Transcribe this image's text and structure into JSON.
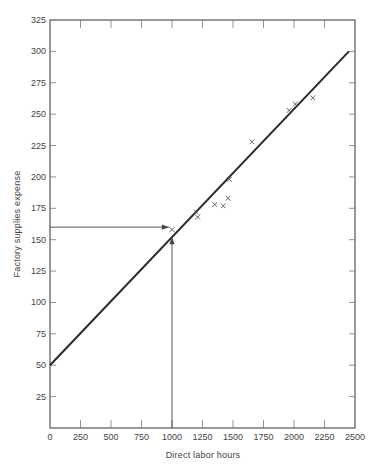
{
  "chart_data": {
    "type": "scatter",
    "title": "",
    "xlabel": "Direct labor hours",
    "ylabel": "Factory supplies expense",
    "xlim": [
      0,
      2500
    ],
    "ylim": [
      0,
      325
    ],
    "x_ticks": [
      0,
      250,
      500,
      750,
      1000,
      1250,
      1500,
      1750,
      2000,
      2250,
      2500
    ],
    "y_ticks": [
      25,
      50,
      75,
      100,
      125,
      150,
      175,
      200,
      225,
      250,
      275,
      300,
      325
    ],
    "grid": false,
    "legend": null,
    "series": [
      {
        "name": "Observations",
        "marker": "x",
        "points": [
          {
            "x": 1000,
            "y": 158
          },
          {
            "x": 1200,
            "y": 172
          },
          {
            "x": 1210,
            "y": 168
          },
          {
            "x": 1350,
            "y": 178
          },
          {
            "x": 1420,
            "y": 177
          },
          {
            "x": 1460,
            "y": 183
          },
          {
            "x": 1470,
            "y": 198
          },
          {
            "x": 1655,
            "y": 228
          },
          {
            "x": 1960,
            "y": 253
          },
          {
            "x": 2010,
            "y": 258
          },
          {
            "x": 2155,
            "y": 263
          }
        ]
      },
      {
        "name": "Fitted line",
        "type": "line",
        "points": [
          {
            "x": 0,
            "y": 50
          },
          {
            "x": 2450,
            "y": 300
          }
        ]
      }
    ],
    "annotations": [
      {
        "type": "arrow",
        "from": {
          "x": 0,
          "y": 160
        },
        "to": {
          "x": 975,
          "y": 160
        },
        "note": "horizontal arrow to estimate at 1000 hours"
      },
      {
        "type": "arrow",
        "from": {
          "x": 1000,
          "y": 0
        },
        "to": {
          "x": 1000,
          "y": 152
        },
        "note": "vertical arrow from 1000 hours"
      }
    ]
  },
  "colors": {
    "line": "#2a2a2a",
    "frame": "#555555",
    "marker": "#555555",
    "text": "#444444"
  }
}
